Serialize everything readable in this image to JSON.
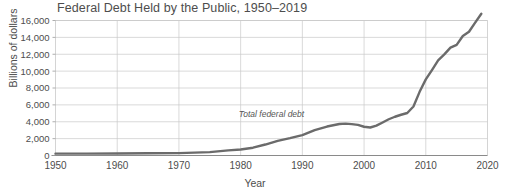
{
  "chart_data": {
    "type": "line",
    "title": "Federal Debt Held by the Public, 1950–2019",
    "xlabel": "Year",
    "ylabel": "Billions of dollars",
    "xlim": [
      1950,
      2020
    ],
    "ylim": [
      0,
      16000
    ],
    "grid": true,
    "legend_position": "none",
    "annotations": [
      {
        "text": "Total federal debt",
        "x": 1985,
        "y": 4600,
        "style": "italic"
      }
    ],
    "xticks": [
      1950,
      1960,
      1970,
      1980,
      1990,
      2000,
      2010,
      2020
    ],
    "xtick_labels": [
      "1950",
      "1960",
      "1970",
      "1980",
      "1990",
      "2000",
      "2010",
      "2020"
    ],
    "yticks": [
      0,
      2000,
      4000,
      6000,
      8000,
      10000,
      12000,
      14000,
      16000
    ],
    "ytick_labels": [
      "0",
      "2,000",
      "4,000",
      "6,000",
      "8,000",
      "10,000",
      "12,000",
      "14,000",
      "16,000"
    ],
    "series": [
      {
        "name": "Total federal debt",
        "color": "#6b6b6b",
        "x": [
          1950,
          1955,
          1960,
          1965,
          1970,
          1975,
          1978,
          1980,
          1982,
          1984,
          1986,
          1988,
          1990,
          1992,
          1994,
          1996,
          1997,
          1998,
          1999,
          2000,
          2001,
          2002,
          2003,
          2004,
          2005,
          2006,
          2007,
          2008,
          2009,
          2010,
          2011,
          2012,
          2013,
          2014,
          2015,
          2016,
          2017,
          2018,
          2019
        ],
        "values": [
          219,
          227,
          237,
          261,
          283,
          395,
          607,
          712,
          925,
          1300,
          1737,
          2050,
          2412,
          3000,
          3433,
          3734,
          3772,
          3721,
          3632,
          3410,
          3320,
          3540,
          3913,
          4296,
          4592,
          4829,
          5035,
          5803,
          7545,
          9019,
          10128,
          11281,
          11983,
          12780,
          13117,
          14168,
          14665,
          15750,
          16800
        ]
      }
    ]
  }
}
